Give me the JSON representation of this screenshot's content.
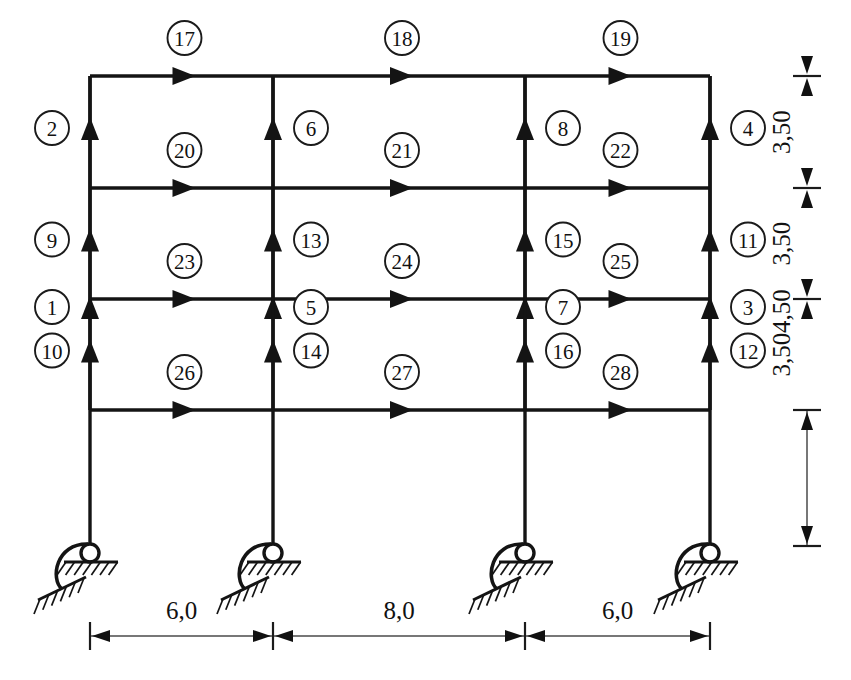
{
  "diagram": {
    "type": "structural-frame",
    "geometry": {
      "bays": 3,
      "storeys": 4,
      "column_x": [
        90,
        273,
        525,
        710
      ],
      "floor_y": [
        76,
        188,
        299,
        410
      ],
      "base_y": 546
    },
    "columns": [
      {
        "id": "1",
        "x_index": 0,
        "segment": 0,
        "label": "1",
        "side": "left"
      },
      {
        "id": "2",
        "x_index": 0,
        "segment": 1,
        "label": "2",
        "side": "left"
      },
      {
        "id": "9",
        "x_index": 0,
        "segment": 2,
        "label": "9",
        "side": "left"
      },
      {
        "id": "10",
        "x_index": 0,
        "segment": 3,
        "label": "10",
        "side": "left"
      },
      {
        "id": "5",
        "x_index": 1,
        "segment": 0,
        "label": "5",
        "side": "right"
      },
      {
        "id": "6",
        "x_index": 1,
        "segment": 1,
        "label": "6",
        "side": "right"
      },
      {
        "id": "13",
        "x_index": 1,
        "segment": 2,
        "label": "13",
        "side": "right"
      },
      {
        "id": "14",
        "x_index": 1,
        "segment": 3,
        "label": "14",
        "side": "right"
      },
      {
        "id": "7",
        "x_index": 2,
        "segment": 0,
        "label": "7",
        "side": "right"
      },
      {
        "id": "8",
        "x_index": 2,
        "segment": 1,
        "label": "8",
        "side": "right"
      },
      {
        "id": "15",
        "x_index": 2,
        "segment": 2,
        "label": "15",
        "side": "right"
      },
      {
        "id": "16",
        "x_index": 2,
        "segment": 3,
        "label": "16",
        "side": "right"
      },
      {
        "id": "3",
        "x_index": 3,
        "segment": 0,
        "label": "3",
        "side": "right"
      },
      {
        "id": "4",
        "x_index": 3,
        "segment": 1,
        "label": "4",
        "side": "right"
      },
      {
        "id": "11",
        "x_index": 3,
        "segment": 2,
        "label": "11",
        "side": "right"
      },
      {
        "id": "12",
        "x_index": 3,
        "segment": 3,
        "label": "12",
        "side": "right"
      }
    ],
    "beams": [
      {
        "id": "17",
        "floor": 0,
        "bay": 0,
        "label": "17"
      },
      {
        "id": "18",
        "floor": 0,
        "bay": 1,
        "label": "18"
      },
      {
        "id": "19",
        "floor": 0,
        "bay": 2,
        "label": "19"
      },
      {
        "id": "20",
        "floor": 1,
        "bay": 0,
        "label": "20"
      },
      {
        "id": "21",
        "floor": 1,
        "bay": 1,
        "label": "21"
      },
      {
        "id": "22",
        "floor": 1,
        "bay": 2,
        "label": "22"
      },
      {
        "id": "23",
        "floor": 2,
        "bay": 0,
        "label": "23"
      },
      {
        "id": "24",
        "floor": 2,
        "bay": 1,
        "label": "24"
      },
      {
        "id": "25",
        "floor": 2,
        "bay": 2,
        "label": "25"
      },
      {
        "id": "26",
        "floor": 3,
        "bay": 0,
        "label": "26"
      },
      {
        "id": "27",
        "floor": 3,
        "bay": 1,
        "label": "27"
      },
      {
        "id": "28",
        "floor": 3,
        "bay": 2,
        "label": "28"
      }
    ],
    "vertical_dimensions": [
      {
        "label": "3,50",
        "from_floor": 3,
        "to_floor": 2
      },
      {
        "label": "3,50",
        "from_floor": 2,
        "to_floor": 1
      },
      {
        "label": "3,50",
        "from_floor": 1,
        "to_floor": 0
      },
      {
        "label": "4,50",
        "from_floor": 0,
        "to_floor": -1
      }
    ],
    "horizontal_dimensions": [
      {
        "label": "6,0",
        "from_col": 0,
        "to_col": 1
      },
      {
        "label": "8,0",
        "from_col": 1,
        "to_col": 2
      },
      {
        "label": "6,0",
        "from_col": 2,
        "to_col": 3
      }
    ],
    "supports": [
      {
        "id": "support-1",
        "x_index": 0,
        "kind": "pinned-roller"
      },
      {
        "id": "support-2",
        "x_index": 1,
        "kind": "pinned-roller"
      },
      {
        "id": "support-3",
        "x_index": 2,
        "kind": "pinned-roller"
      },
      {
        "id": "support-4",
        "x_index": 3,
        "kind": "pinned-roller"
      }
    ],
    "colors": {
      "ink": "#141414",
      "dimension": "#4a4a4a",
      "background": "#ffffff"
    }
  }
}
